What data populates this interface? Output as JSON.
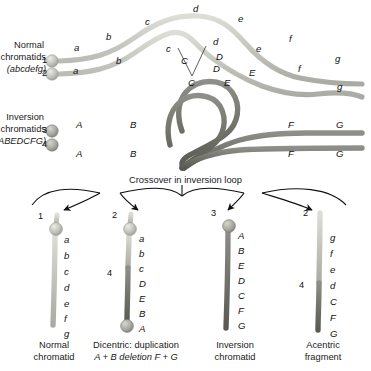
{
  "figure": {
    "type": "biology-diagram"
  },
  "colors": {
    "normal_chromatid": "#c9c9c4",
    "normal_chromatid_dark": "#a9a9a3",
    "inversion_chromatid": "#7a7a76",
    "inversion_chromatid_dark": "#5e5e5a",
    "centromere": "#b9b9b3",
    "text": "#1a1a1a",
    "background": "#ffffff"
  },
  "top_panel": {
    "normal_label": {
      "line1": "Normal",
      "line2": "chromatids",
      "line3": "(abcdefg)"
    },
    "inversion_label": {
      "line1": "Inversion",
      "line2": "chromatids",
      "line3": "(ABEDCFG)"
    },
    "chromatid_numbers": {
      "normal_upper": "1",
      "normal_lower": "2",
      "inversion_upper": "3",
      "inversion_lower": "4"
    },
    "normal_genes_upper": [
      "a",
      "b",
      "c",
      "d",
      "e",
      "f",
      "g"
    ],
    "normal_genes_lower": [
      "a",
      "b",
      "c",
      "d",
      "e",
      "f",
      "g"
    ],
    "inversion_genes_upper": [
      "A",
      "B",
      "C",
      "D",
      "E",
      "F",
      "G"
    ],
    "inversion_genes_lower": [
      "A",
      "B",
      "C",
      "D",
      "E",
      "F",
      "G"
    ],
    "loop_labels_normal": [
      "c",
      "d",
      "C",
      "D"
    ],
    "loop_labels_inversion": [
      "C",
      "D",
      "E",
      "C",
      "D",
      "E"
    ],
    "crossover_caption": "Crossover in inversion loop"
  },
  "products": [
    {
      "number": "1",
      "second_number": "",
      "genes": [
        "a",
        "b",
        "c",
        "d",
        "e",
        "f",
        "g"
      ],
      "caption_line1": "Normal",
      "caption_line2": "chromatid",
      "caption_line3": "",
      "has_top_centromere": true,
      "has_bottom_centromere": false
    },
    {
      "number": "2",
      "second_number": "4",
      "genes": [
        "a",
        "b",
        "c",
        "D",
        "E",
        "B",
        "A"
      ],
      "caption_line1": "Dicentric: duplication",
      "caption_line2": "A + B deletion F + G",
      "caption_line3": "",
      "has_top_centromere": true,
      "has_bottom_centromere": true
    },
    {
      "number": "3",
      "second_number": "",
      "genes": [
        "A",
        "B",
        "E",
        "D",
        "C",
        "F",
        "G"
      ],
      "caption_line1": "Inversion",
      "caption_line2": "chromatid",
      "caption_line3": "",
      "has_top_centromere": true,
      "has_bottom_centromere": false
    },
    {
      "number": "2",
      "second_number": "4",
      "genes": [
        "g",
        "f",
        "e",
        "d",
        "C",
        "F",
        "G"
      ],
      "caption_line1": "Acentric",
      "caption_line2": "fragment",
      "caption_line3": "",
      "has_top_centromere": false,
      "has_bottom_centromere": false
    }
  ]
}
